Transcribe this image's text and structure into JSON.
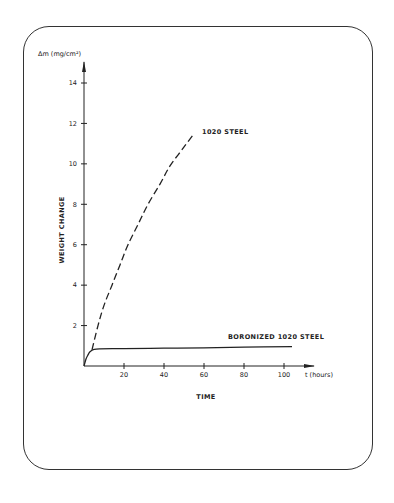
{
  "chart_data": {
    "type": "line",
    "title": "",
    "xlabel": "TIME",
    "x_unit_label": "t (hours)",
    "ylabel": "WEIGHT CHANGE",
    "y_unit_label": "Δm (mg/cm²)",
    "xlim": [
      0,
      110
    ],
    "ylim": [
      0,
      15
    ],
    "x_ticks": [
      20,
      40,
      60,
      80,
      100
    ],
    "x_tick_labels": [
      "20",
      "40",
      "60",
      "80",
      "100"
    ],
    "y_ticks": [
      2,
      4,
      6,
      8,
      10,
      12,
      14
    ],
    "y_tick_labels": [
      "2",
      "4",
      "6",
      "8",
      "10",
      "12",
      "14"
    ],
    "grid": false,
    "series": [
      {
        "name": "1020 STEEL",
        "style": "dashed",
        "x": [
          4,
          7,
          10,
          14,
          18,
          22,
          27,
          32,
          38,
          43,
          49,
          55
        ],
        "y": [
          0.8,
          2.0,
          3.0,
          4.0,
          5.0,
          6.0,
          7.0,
          8.0,
          9.0,
          9.9,
          10.7,
          11.5
        ]
      },
      {
        "name": "BORONIZED 1020 STEEL",
        "style": "solid",
        "x": [
          0,
          1,
          2,
          3,
          5,
          8,
          20,
          40,
          60,
          80,
          104
        ],
        "y": [
          0,
          0.35,
          0.55,
          0.7,
          0.82,
          0.85,
          0.86,
          0.88,
          0.9,
          0.93,
          0.96
        ]
      }
    ],
    "annotations": [
      {
        "text": "1020 STEEL",
        "series": "1020 STEEL"
      },
      {
        "text": "BORONIZED 1020 STEEL",
        "series": "BORONIZED 1020 STEEL"
      }
    ],
    "colors": {
      "ink": "#222222",
      "background": "#ffffff"
    }
  }
}
